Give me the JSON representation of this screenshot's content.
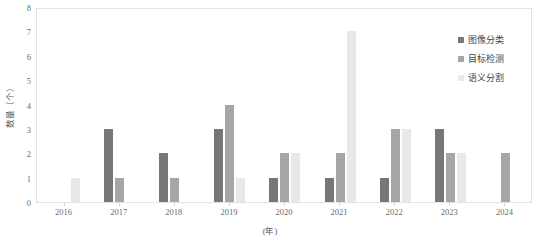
{
  "chart_data": {
    "type": "bar",
    "title": "",
    "subtitle": "",
    "xlabel": "(年)",
    "ylabel": "数量（个）",
    "categories": [
      "2016",
      "2017",
      "2018",
      "2019",
      "2020",
      "2021",
      "2022",
      "2023",
      "2024"
    ],
    "series": [
      {
        "name": "图像分类",
        "color": "#777777",
        "values": [
          0,
          3,
          2,
          3,
          1,
          1,
          1,
          3,
          0
        ]
      },
      {
        "name": "目标检测",
        "color": "#a6a6a6",
        "values": [
          0,
          1,
          1,
          4,
          2,
          2,
          3,
          2,
          2
        ]
      },
      {
        "name": "语义分割",
        "color": "#e8e8e8",
        "values": [
          1,
          0,
          0,
          1,
          2,
          7,
          3,
          2,
          0
        ]
      }
    ],
    "ylim": [
      0,
      8
    ],
    "yticks": [
      "0",
      "1",
      "2",
      "3",
      "4",
      "5",
      "6",
      "7",
      "8"
    ],
    "ytick_values": [
      0,
      1,
      2,
      3,
      4,
      5,
      6,
      7,
      8
    ],
    "grid": false,
    "legend_position": "top-right",
    "plot_border_color": "#e3e3e3",
    "background_color": "#ffffff"
  },
  "legend": {
    "items": [
      {
        "label": "图像分类"
      },
      {
        "label": "目标检测"
      },
      {
        "label": "语义分割"
      }
    ]
  }
}
